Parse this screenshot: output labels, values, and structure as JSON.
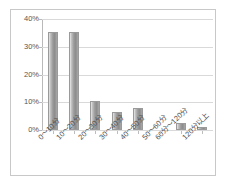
{
  "chart_data": {
    "type": "bar",
    "title": "",
    "subtitle": "",
    "xlabel": "",
    "ylabel": "",
    "categories": [
      "0〜10分",
      "10〜20分",
      "20〜30分",
      "30〜40分",
      "40〜50分",
      "50〜60分",
      "60分〜120分",
      "120分以上"
    ],
    "values": [
      35.2,
      35.2,
      10.6,
      6.6,
      8.0,
      0.0,
      2.5,
      1.2
    ],
    "value_suffix": "%",
    "ylim": [
      0,
      40
    ],
    "ytick_values": [
      0,
      10,
      20,
      30,
      40
    ],
    "ytick_labels": [
      "0%",
      "10%",
      "20%",
      "30%",
      "40%"
    ],
    "grid": true,
    "grid_axis": "y",
    "legend": false,
    "legend_position": "none",
    "series": [
      {
        "name": "",
        "values": [
          35.2,
          35.2,
          10.6,
          6.6,
          8.0,
          0.0,
          2.5,
          1.2
        ]
      }
    ]
  },
  "style": {
    "bar_fill_light": "#efefef",
    "bar_fill_dark": "#8c8c8c",
    "bar_border": "#9a9a9a",
    "gridline_color": "#d9d9d9",
    "axis_color": "#b9b9b9",
    "frame_border": "#c8c8c8",
    "tick_label_color": "#555555",
    "plot_background": "#ffffff"
  }
}
